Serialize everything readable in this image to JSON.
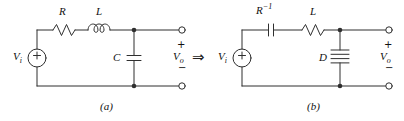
{
  "figure": {
    "arrow_glyph": "⇒",
    "colors": {
      "line": "#2f2f2f",
      "text": "#111111",
      "background": "#ffffff"
    },
    "circuit_a": {
      "caption": "(a)",
      "source_label": {
        "base": "V",
        "sub": "i"
      },
      "series_element_1": "R",
      "series_element_2": "L",
      "shunt_element": "C",
      "output": {
        "plus": "+",
        "base": "V",
        "sub": "o",
        "minus": "−"
      }
    },
    "circuit_b": {
      "caption": "(b)",
      "source_label": {
        "base": "V",
        "sub": "i"
      },
      "series_element_1": {
        "base": "R",
        "sup": "−1"
      },
      "series_element_2": "L",
      "shunt_element": "D",
      "output": {
        "plus": "+",
        "base": "V",
        "sub": "o",
        "minus": "−"
      }
    }
  }
}
